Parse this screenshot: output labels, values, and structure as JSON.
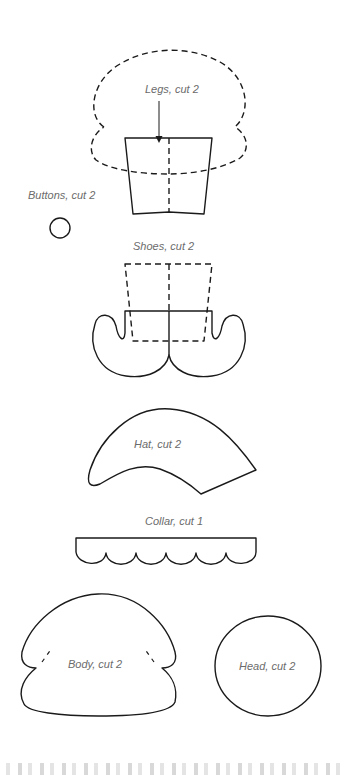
{
  "page": {
    "background": "#ffffff",
    "line_color": "#1a1a1a",
    "label_color": "#6b6b6b"
  },
  "pieces": {
    "legs": {
      "label": "Legs, cut 2"
    },
    "buttons": {
      "label": "Buttons, cut 2"
    },
    "shoes": {
      "label": "Shoes, cut 2"
    },
    "hat": {
      "label": "Hat, cut 2"
    },
    "collar": {
      "label": "Collar, cut 1"
    },
    "body": {
      "label": "Body, cut 2"
    },
    "head": {
      "label": "Head, cut 2"
    }
  }
}
